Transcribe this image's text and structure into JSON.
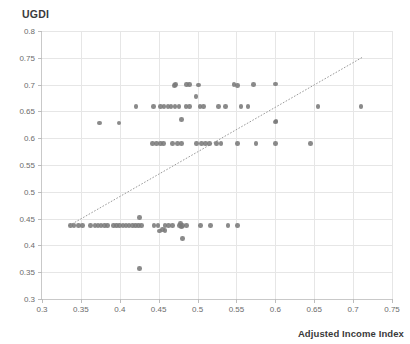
{
  "chart_data": {
    "type": "scatter",
    "title": "",
    "ylabel": "UGDI",
    "xlabel": "Adjusted Income Index",
    "xlim": [
      0.3,
      0.75
    ],
    "ylim": [
      0.3,
      0.8
    ],
    "xticks": [
      "0.3",
      "0.35",
      "0.4",
      "0.45",
      "0.5",
      "0.55",
      "0.6",
      "0.65",
      "0.7",
      "0.75"
    ],
    "xtick_values": [
      0.3,
      0.35,
      0.4,
      0.45,
      0.5,
      0.55,
      0.6,
      0.65,
      0.7,
      0.75
    ],
    "yticks": [
      "0.3",
      "0.35",
      "0.4",
      "0.45",
      "0.5",
      "0.55",
      "0.6",
      "0.65",
      "0.7",
      "0.75",
      "0.8"
    ],
    "ytick_values": [
      0.3,
      0.35,
      0.4,
      0.45,
      0.5,
      0.55,
      0.6,
      0.65,
      0.7,
      0.75,
      0.8
    ],
    "grid": true,
    "legend": "none",
    "marker_color": "#7a7a7a",
    "reference_line": {
      "style": "dotted",
      "color": "#9a9a9a",
      "x0": 0.335,
      "y0": 0.437,
      "x1": 0.712,
      "y1": 0.751
    },
    "points": [
      [
        0.337,
        0.437
      ],
      [
        0.341,
        0.437
      ],
      [
        0.347,
        0.437
      ],
      [
        0.352,
        0.437
      ],
      [
        0.362,
        0.437
      ],
      [
        0.368,
        0.437
      ],
      [
        0.372,
        0.437
      ],
      [
        0.376,
        0.437
      ],
      [
        0.38,
        0.437
      ],
      [
        0.384,
        0.437
      ],
      [
        0.392,
        0.437
      ],
      [
        0.396,
        0.437
      ],
      [
        0.4,
        0.437
      ],
      [
        0.404,
        0.437
      ],
      [
        0.408,
        0.437
      ],
      [
        0.412,
        0.437
      ],
      [
        0.416,
        0.437
      ],
      [
        0.42,
        0.437
      ],
      [
        0.424,
        0.437
      ],
      [
        0.428,
        0.437
      ],
      [
        0.444,
        0.437
      ],
      [
        0.449,
        0.437
      ],
      [
        0.458,
        0.437
      ],
      [
        0.463,
        0.437
      ],
      [
        0.468,
        0.437
      ],
      [
        0.477,
        0.437
      ],
      [
        0.481,
        0.437
      ],
      [
        0.486,
        0.437
      ],
      [
        0.504,
        0.437
      ],
      [
        0.517,
        0.437
      ],
      [
        0.539,
        0.437
      ],
      [
        0.551,
        0.437
      ],
      [
        0.425,
        0.452
      ],
      [
        0.455,
        0.43
      ],
      [
        0.451,
        0.427
      ],
      [
        0.458,
        0.428
      ],
      [
        0.478,
        0.441
      ],
      [
        0.479,
        0.434
      ],
      [
        0.481,
        0.413
      ],
      [
        0.425,
        0.357
      ],
      [
        0.442,
        0.59
      ],
      [
        0.447,
        0.59
      ],
      [
        0.452,
        0.59
      ],
      [
        0.456,
        0.59
      ],
      [
        0.468,
        0.59
      ],
      [
        0.474,
        0.59
      ],
      [
        0.479,
        0.59
      ],
      [
        0.499,
        0.59
      ],
      [
        0.505,
        0.59
      ],
      [
        0.51,
        0.59
      ],
      [
        0.515,
        0.59
      ],
      [
        0.524,
        0.59
      ],
      [
        0.53,
        0.59
      ],
      [
        0.551,
        0.59
      ],
      [
        0.575,
        0.59
      ],
      [
        0.6,
        0.59
      ],
      [
        0.645,
        0.59
      ],
      [
        0.6,
        0.63
      ],
      [
        0.601,
        0.632
      ],
      [
        0.374,
        0.628
      ],
      [
        0.399,
        0.628
      ],
      [
        0.421,
        0.659
      ],
      [
        0.443,
        0.659
      ],
      [
        0.452,
        0.659
      ],
      [
        0.457,
        0.659
      ],
      [
        0.462,
        0.659
      ],
      [
        0.466,
        0.659
      ],
      [
        0.471,
        0.659
      ],
      [
        0.476,
        0.659
      ],
      [
        0.485,
        0.659
      ],
      [
        0.49,
        0.659
      ],
      [
        0.503,
        0.659
      ],
      [
        0.508,
        0.659
      ],
      [
        0.527,
        0.659
      ],
      [
        0.536,
        0.659
      ],
      [
        0.556,
        0.659
      ],
      [
        0.565,
        0.659
      ],
      [
        0.655,
        0.659
      ],
      [
        0.71,
        0.659
      ],
      [
        0.47,
        0.698
      ],
      [
        0.472,
        0.7
      ],
      [
        0.486,
        0.7
      ],
      [
        0.49,
        0.7
      ],
      [
        0.501,
        0.699
      ],
      [
        0.547,
        0.7
      ],
      [
        0.551,
        0.698
      ],
      [
        0.572,
        0.7
      ],
      [
        0.6,
        0.701
      ],
      [
        0.498,
        0.678
      ],
      [
        0.479,
        0.635
      ]
    ]
  }
}
